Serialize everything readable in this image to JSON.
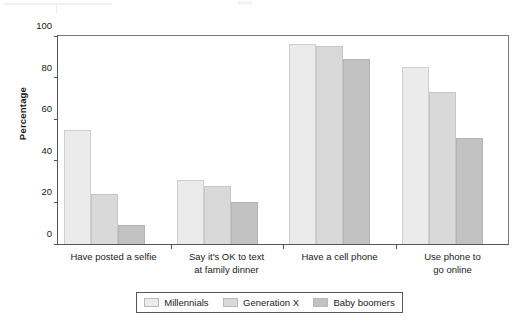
{
  "chart_data": {
    "type": "bar",
    "title": "",
    "xlabel": "",
    "ylabel": "Percentage",
    "ylim": [
      0,
      100
    ],
    "yticks": [
      0,
      20,
      40,
      60,
      80,
      100
    ],
    "grid": false,
    "legend_position": "bottom",
    "categories": [
      "Have posted a selfie",
      "Say it's OK to text at family dinner",
      "Have a cell phone",
      "Use phone to go online"
    ],
    "category_lines": [
      [
        "Have posted a selfie",
        ""
      ],
      [
        "Say it's OK to text",
        "at family dinner"
      ],
      [
        "Have a cell phone",
        ""
      ],
      [
        "Use phone to",
        "go online"
      ]
    ],
    "series": [
      {
        "name": "Millennials",
        "color": "#ebebeb",
        "values": [
          55,
          31,
          96,
          85
        ]
      },
      {
        "name": "Generation X",
        "color": "#d9d9d9",
        "values": [
          24,
          28,
          95,
          73
        ]
      },
      {
        "name": "Baby boomers",
        "color": "#c2c2c2",
        "values": [
          9,
          20,
          89,
          51
        ]
      }
    ]
  },
  "legend": {
    "items": [
      {
        "label": "Millennials"
      },
      {
        "label": "Generation X"
      },
      {
        "label": "Baby boomers"
      }
    ]
  }
}
